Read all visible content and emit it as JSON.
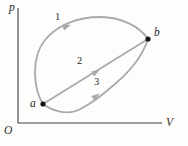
{
  "figure": {
    "type": "pV-cycle-diagram",
    "axis_labels": {
      "y": "p",
      "x": "V",
      "origin": "O"
    },
    "points": {
      "a": {
        "label": "a"
      },
      "b": {
        "label": "b"
      }
    },
    "path_labels": {
      "path1": "1",
      "path2": "2",
      "path3": "3"
    },
    "colors": {
      "curve": "#aaaaaa",
      "axis": "#3d3d3d",
      "point": "#141414",
      "text": "#2b2b2b"
    },
    "geometry": {
      "axis_y_d": "M18,8 L18,123",
      "axis_x_d": "M18,123 L162,123",
      "path1_d": "M43,104 C33,88 31,57 45,40 C57,25 78,17 100,17 C121,17 139,26 148,39",
      "path2_d": "M43,104 L148,39",
      "path3_d": "M43,104 C56,113 70,116 84,107 C93,102 101,96 109,89 C123,78 141,61 148,39",
      "arrow_points": "1,0 -7.5,3 -7.5,-3",
      "arrow1_transform": "translate(70,25) rotate(-22)",
      "arrow2_transform": "translate(99,70) rotate(-31.8)",
      "arrow3_transform": "translate(99,94) rotate(-36)"
    }
  }
}
